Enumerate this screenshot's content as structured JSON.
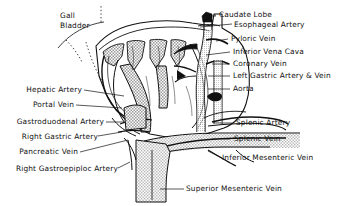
{
  "figure": {
    "background_color": "#ffffff",
    "ink_color": "#111111",
    "shade_color": "#b8b8b8",
    "width": 356,
    "height": 206
  },
  "labels": {
    "gall_bladder_line1": "Gall",
    "gall_bladder_line2": "Bladder",
    "caudate_lobe": "Caudate Lobe",
    "esophageal_artery": "Esophageal Artery",
    "pyloric_vein": "Pyloric Vein",
    "inferior_vena_cava": "Inferior Vena Cava",
    "coronary_vein": "Coronary Vein",
    "left_gastric_artery_vein": "Left Gastric Artery & Vein",
    "aorta": "Aorta",
    "splenic_artery": "Splenic Artery",
    "splenic_vein": "Splenic Vein",
    "inferior_mesenteric_vein": "Inferior Mesenteric  Vein",
    "superior_mesenteric_vein": "Superior  Mesenteric Vein",
    "hepatic_artery": "Hepatic Artery",
    "portal_vein": "Portal Vein",
    "gastroduodenal_artery": "Gastroduodenal Artery",
    "right_gastric_artery": "Right Gastric Artery",
    "pancreatic_vein": "Pancreatic Vein",
    "right_gastroepiploic_artery": "Right Gastroepiploc Artery"
  }
}
